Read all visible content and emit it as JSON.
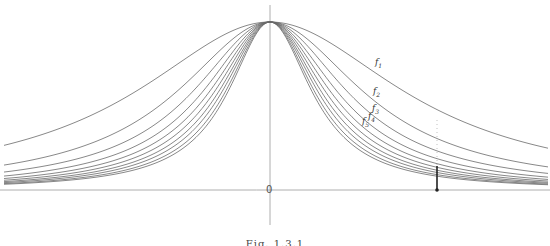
{
  "figure": {
    "caption": "Fig. 1.3.1",
    "origin_label": "0",
    "curve_labels": [
      {
        "id": "f1",
        "base": "f",
        "sub": "1",
        "x": 375,
        "y": 58
      },
      {
        "id": "f2",
        "base": "f",
        "sub": "2",
        "x": 373,
        "y": 87
      },
      {
        "id": "f3",
        "base": "f",
        "sub": "3",
        "x": 372,
        "y": 104
      },
      {
        "id": "f4",
        "base": "f",
        "sub": "4",
        "x": 368,
        "y": 112
      },
      {
        "id": "f5",
        "base": "f",
        "sub": "5",
        "x": 362,
        "y": 117
      }
    ]
  },
  "chart_data": {
    "type": "line",
    "title": "",
    "xlabel": "",
    "ylabel": "",
    "peak": {
      "x": 0,
      "y": 1
    },
    "series": [
      {
        "name": "f1",
        "width": 160
      },
      {
        "name": "f2",
        "width": 111
      },
      {
        "name": "f3",
        "width": 92
      },
      {
        "name": "f4",
        "width": 80
      },
      {
        "name": "f5",
        "width": 72
      },
      {
        "name": "f6",
        "width": 66
      },
      {
        "name": "f7",
        "width": 61
      },
      {
        "name": "f8",
        "width": 57
      },
      {
        "name": "f9",
        "width": 53
      },
      {
        "name": "f10",
        "width": 50
      }
    ],
    "marker_x": 167,
    "grid": false,
    "legend": "inline labels f1-f5"
  },
  "style": {
    "curve_color": "#6a6a6a",
    "axis_color": "#9a9a9a",
    "marker_color": "#222222"
  }
}
